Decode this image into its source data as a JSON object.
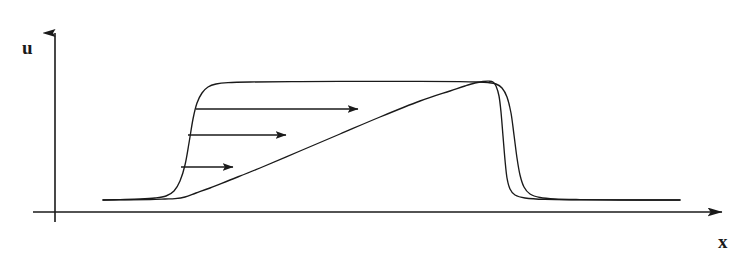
{
  "figure": {
    "kind": "line-diagram",
    "caption_text": "",
    "background_color": "#ffffff",
    "stroke_color": "#1a1a1a",
    "width": 756,
    "height": 269
  },
  "axes": {
    "y_axis": {
      "label": "u",
      "label_x": 22,
      "label_y": 38,
      "x": 55,
      "y_top": 20,
      "y_bottom": 222,
      "arrow": "up-arrow"
    },
    "x_axis": {
      "label": "x",
      "label_x": 718,
      "label_y": 232,
      "y": 212,
      "x_left": 33,
      "x_right": 737,
      "arrow": "right-arrow"
    }
  },
  "chart_data": {
    "type": "line",
    "title": "",
    "xlabel": "x",
    "ylabel": "u",
    "grid": false,
    "legend": "none",
    "xlim": [
      33,
      737
    ],
    "ylim": [
      212,
      20
    ],
    "series": [
      {
        "name": "initial-plateau-pulse",
        "description": "Smooth plateau profile: flat low tail, steep rise, flat top, steep fall, flat low tail.",
        "points": [
          [
            103,
            200
          ],
          [
            120,
            199.6
          ],
          [
            140,
            199
          ],
          [
            155,
            198
          ],
          [
            166,
            196
          ],
          [
            174,
            191
          ],
          [
            180,
            181
          ],
          [
            185,
            165
          ],
          [
            189,
            143
          ],
          [
            193,
            119
          ],
          [
            197,
            103
          ],
          [
            202,
            93
          ],
          [
            208,
            87
          ],
          [
            216,
            84
          ],
          [
            228,
            82.6
          ],
          [
            250,
            82
          ],
          [
            300,
            81.6
          ],
          [
            360,
            81.4
          ],
          [
            420,
            81.4
          ],
          [
            460,
            81.6
          ],
          [
            478,
            82
          ],
          [
            488,
            82.6
          ],
          [
            496,
            84
          ],
          [
            502,
            88
          ],
          [
            507,
            97
          ],
          [
            511,
            113
          ],
          [
            514,
            135
          ],
          [
            517,
            158
          ],
          [
            520,
            175
          ],
          [
            524,
            187
          ],
          [
            530,
            194
          ],
          [
            540,
            197.5
          ],
          [
            555,
            199
          ],
          [
            580,
            199.6
          ],
          [
            620,
            200
          ],
          [
            680,
            200
          ]
        ]
      },
      {
        "name": "steepened-wave-profile",
        "description": "Evolved profile: long linear rarefaction ramp rising from the low tail to the peak, then an almost vertical shock front dropping back to the low tail.",
        "points": [
          [
            103,
            200
          ],
          [
            130,
            199.8
          ],
          [
            150,
            199.5
          ],
          [
            165,
            199
          ],
          [
            175,
            198.6
          ],
          [
            185,
            197
          ],
          [
            196,
            193
          ],
          [
            210,
            188
          ],
          [
            230,
            180
          ],
          [
            260,
            168
          ],
          [
            300,
            151
          ],
          [
            340,
            134
          ],
          [
            380,
            117
          ],
          [
            420,
            101
          ],
          [
            450,
            91
          ],
          [
            465,
            86
          ],
          [
            475,
            83
          ],
          [
            483,
            81.5
          ],
          [
            489,
            81.2
          ],
          [
            493,
            82
          ],
          [
            496,
            86
          ],
          [
            499,
            96
          ],
          [
            501,
            112
          ],
          [
            503,
            136
          ],
          [
            505,
            160
          ],
          [
            507,
            178
          ],
          [
            510,
            189
          ],
          [
            515,
            195
          ],
          [
            525,
            198
          ],
          [
            545,
            199.4
          ],
          [
            580,
            199.8
          ],
          [
            640,
            200
          ],
          [
            680,
            200
          ]
        ]
      }
    ],
    "annotations": [
      {
        "name": "velocity-arrow-top",
        "type": "arrow",
        "direction": "right",
        "x1": 196,
        "y1": 109,
        "x2": 358,
        "y2": 109,
        "length": 162
      },
      {
        "name": "velocity-arrow-middle",
        "type": "arrow",
        "direction": "right",
        "x1": 188,
        "y1": 135,
        "x2": 286,
        "y2": 135,
        "length": 98
      },
      {
        "name": "velocity-arrow-bottom",
        "type": "arrow",
        "direction": "right",
        "x1": 181,
        "y1": 167,
        "x2": 233,
        "y2": 167,
        "length": 52
      }
    ]
  }
}
